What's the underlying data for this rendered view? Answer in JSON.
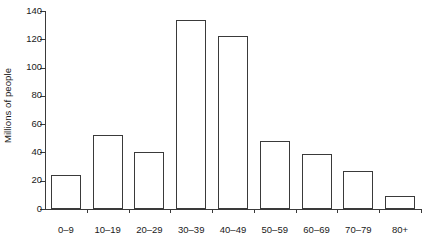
{
  "chart_data": {
    "type": "bar",
    "title": "",
    "xlabel": "",
    "ylabel": "Millions of people",
    "categories": [
      "0–9",
      "10–19",
      "20–29",
      "30–39",
      "40–49",
      "50–59",
      "60–69",
      "70–79",
      "80+"
    ],
    "values": [
      24,
      52,
      40,
      134,
      122,
      48,
      39,
      27,
      9
    ],
    "ylim": [
      0,
      140
    ],
    "yticks": [
      0,
      20,
      40,
      60,
      80,
      100,
      120,
      140
    ],
    "ytick_labels": [
      "0",
      "20",
      "40",
      "60",
      "80",
      "100",
      "120",
      "140"
    ],
    "grid": false,
    "legend": null,
    "bar_fill_color": "#ffffff",
    "bar_edge_color": "#3a3a3a",
    "axis_color": "#3a3a3a",
    "text_color": "#1a1a1a",
    "background_color": "#ffffff"
  }
}
